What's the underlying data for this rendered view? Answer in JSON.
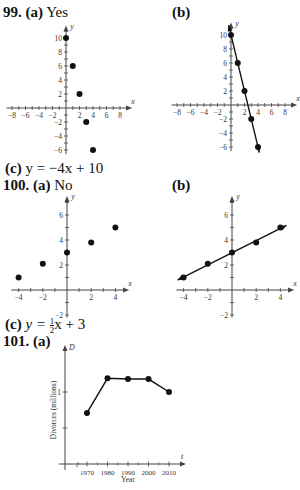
{
  "problem_99": {
    "number": "99.",
    "part_a_label": "(a)",
    "part_a_answer": "Yes",
    "part_b_label": "(b)",
    "part_c_label": "(c)",
    "part_c_equation": "y = −4x + 10"
  },
  "problem_100": {
    "number": "100.",
    "part_a_label": "(a)",
    "part_a_answer": "No",
    "part_b_label": "(b)",
    "part_c_label": "(c)",
    "part_c_eq_prefix": "y = ",
    "part_c_frac_num": "1",
    "part_c_frac_den": "2",
    "part_c_eq_suffix": "x + 3"
  },
  "problem_101": {
    "number": "101.",
    "part_a_label": "(a)"
  },
  "chart_data": [
    {
      "id": "99a",
      "type": "scatter",
      "title": "",
      "xlabel": "x",
      "ylabel": "y",
      "xlim": [
        -8,
        8
      ],
      "ylim": [
        -6,
        10
      ],
      "x_ticks": [
        -8,
        -6,
        -4,
        -2,
        2,
        4,
        6,
        8
      ],
      "y_ticks": [
        -6,
        -4,
        -2,
        2,
        4,
        6,
        8,
        10
      ],
      "x": [
        0,
        1,
        2,
        3,
        4
      ],
      "y": [
        10,
        6,
        2,
        -2,
        -6
      ],
      "grid": false
    },
    {
      "id": "99b",
      "type": "line",
      "title": "",
      "xlabel": "x",
      "ylabel": "y",
      "xlim": [
        -8,
        8
      ],
      "ylim": [
        -6,
        10
      ],
      "x_ticks": [
        -8,
        -6,
        -4,
        -2,
        2,
        4,
        6,
        8
      ],
      "y_ticks": [
        -6,
        -4,
        -2,
        2,
        4,
        6,
        8,
        10
      ],
      "x": [
        0,
        1,
        2,
        3,
        4
      ],
      "y": [
        10,
        6,
        2,
        -2,
        -6
      ],
      "fit_line": "y = -4x + 10",
      "grid": false
    },
    {
      "id": "100a",
      "type": "scatter",
      "title": "",
      "xlabel": "x",
      "ylabel": "y",
      "xlim": [
        -4,
        4
      ],
      "ylim": [
        -2,
        6
      ],
      "x_ticks": [
        -4,
        -2,
        2,
        4
      ],
      "y_ticks": [
        -2,
        2,
        4,
        6
      ],
      "x": [
        -4,
        -2,
        0,
        2,
        4
      ],
      "y": [
        1,
        2.1,
        3,
        3.8,
        5
      ],
      "grid": false
    },
    {
      "id": "100b",
      "type": "line",
      "title": "",
      "xlabel": "x",
      "ylabel": "y",
      "xlim": [
        -4,
        4
      ],
      "ylim": [
        -2,
        6
      ],
      "x_ticks": [
        -4,
        -2,
        2,
        4
      ],
      "y_ticks": [
        -2,
        2,
        4,
        6
      ],
      "x": [
        -4,
        -2,
        0,
        2,
        4
      ],
      "y": [
        1,
        2.1,
        3,
        3.8,
        5
      ],
      "fit_line": "y = 0.5x + 3",
      "grid": false
    },
    {
      "id": "101a",
      "type": "line",
      "title": "",
      "xlabel": "Year",
      "ylabel": "Divorces (millions)",
      "x_axis_var": "t",
      "y_axis_var": "D",
      "categories": [
        "1970",
        "1980",
        "1990",
        "2000",
        "2010"
      ],
      "values": [
        0.71,
        1.19,
        1.18,
        1.18,
        1.0
      ],
      "y_ticks": [
        1
      ],
      "ylim": [
        0,
        1.4
      ],
      "axis_break": true,
      "grid": false
    }
  ]
}
